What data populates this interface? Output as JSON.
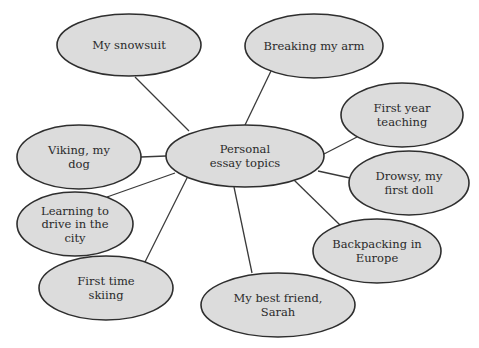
{
  "diagram": {
    "type": "mind-map",
    "center": {
      "id": "center",
      "lines": [
        "Personal",
        "essay topics"
      ],
      "cx": 245,
      "cy": 156,
      "rx": 79,
      "ry": 31
    },
    "nodes": [
      {
        "id": "snowsuit",
        "lines": [
          "My snowsuit"
        ],
        "cx": 129,
        "cy": 45,
        "rx": 72,
        "ry": 31
      },
      {
        "id": "arm",
        "lines": [
          "Breaking my arm"
        ],
        "cx": 314,
        "cy": 46,
        "rx": 69,
        "ry": 32
      },
      {
        "id": "teaching",
        "lines": [
          "First year",
          "teaching"
        ],
        "cx": 402,
        "cy": 115,
        "rx": 61,
        "ry": 32
      },
      {
        "id": "doll",
        "lines": [
          "Drowsy, my",
          "first doll"
        ],
        "cx": 409,
        "cy": 183,
        "rx": 60,
        "ry": 32
      },
      {
        "id": "backpacking",
        "lines": [
          "Backpacking in",
          "Europe"
        ],
        "cx": 377,
        "cy": 251,
        "rx": 64,
        "ry": 32
      },
      {
        "id": "friend",
        "lines": [
          "My best friend,",
          "Sarah"
        ],
        "cx": 278,
        "cy": 305,
        "rx": 77,
        "ry": 32
      },
      {
        "id": "skiing",
        "lines": [
          "First time",
          "skiing"
        ],
        "cx": 106,
        "cy": 288,
        "rx": 67,
        "ry": 32
      },
      {
        "id": "driving",
        "lines": [
          "Learning to",
          "drive in the",
          "city"
        ],
        "cx": 75,
        "cy": 224,
        "rx": 58,
        "ry": 32
      },
      {
        "id": "viking",
        "lines": [
          "Viking, my",
          "dog"
        ],
        "cx": 79,
        "cy": 157,
        "rx": 62,
        "ry": 32
      }
    ],
    "edges": [
      {
        "to": "snowsuit",
        "x1": 189,
        "y1": 131,
        "x2": 135,
        "y2": 77
      },
      {
        "to": "arm",
        "x1": 245,
        "y1": 125,
        "x2": 271,
        "y2": 71
      },
      {
        "to": "teaching",
        "x1": 324,
        "y1": 154,
        "x2": 357,
        "y2": 137
      },
      {
        "to": "doll",
        "x1": 318,
        "y1": 171,
        "x2": 350,
        "y2": 178
      },
      {
        "to": "backpacking",
        "x1": 294,
        "y1": 180,
        "x2": 340,
        "y2": 225
      },
      {
        "to": "friend",
        "x1": 234,
        "y1": 187,
        "x2": 252,
        "y2": 273
      },
      {
        "to": "skiing",
        "x1": 188,
        "y1": 176,
        "x2": 145,
        "y2": 262
      },
      {
        "to": "driving",
        "x1": 175,
        "y1": 173,
        "x2": 107,
        "y2": 197
      },
      {
        "to": "viking",
        "x1": 166,
        "y1": 156,
        "x2": 141,
        "y2": 157
      }
    ],
    "colors": {
      "fill": "#dcdcdc",
      "stroke": "#2e2e2e",
      "text": "#2a2a2a",
      "background": "#ffffff"
    }
  }
}
